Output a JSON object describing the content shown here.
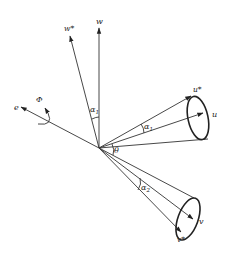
{
  "diagram": {
    "type": "vector-cone-diagram",
    "labels": {
      "w": "w",
      "w_star": "w*",
      "e": "e",
      "phi": "Φ",
      "u": "u",
      "u_star": "u*",
      "v": "v",
      "v_star": "v*",
      "alpha1_w": "α",
      "alpha1_w_sub": "1",
      "alpha1_u": "α",
      "alpha1_u_sub": "1",
      "theta": "θ",
      "alpha2": "α",
      "alpha2_sub": "2"
    },
    "colors": {
      "line": "#333333",
      "text": "#222222",
      "background": "#ffffff"
    }
  }
}
